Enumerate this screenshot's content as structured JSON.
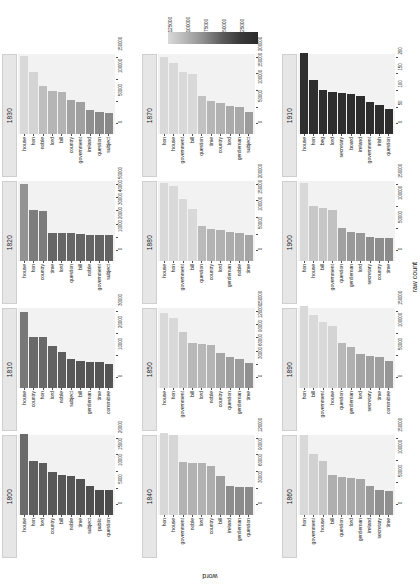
{
  "legend": {
    "title": "",
    "ticks": [
      "125000",
      "100000",
      "75000",
      "50000",
      "25000"
    ],
    "gradient_light": "#d9d9d9",
    "gradient_dark": "#2a2a2a"
  },
  "axes": {
    "y_title": "raw count",
    "x_title": "word"
  },
  "chart_data": {
    "type": "bar",
    "title": "",
    "xlabel": "word",
    "ylabel": "raw count",
    "grid": false,
    "legend_position": "top",
    "colorbar": {
      "ticks": [
        125000,
        100000,
        75000,
        50000,
        25000
      ],
      "maps_to": "raw count",
      "scale": "light = high count, dark = low count"
    },
    "facet_layout": {
      "rows": 4,
      "cols": 3,
      "facet_variable": "decade"
    },
    "facets": [
      {
        "decade": "1830",
        "ylim": [
          0,
          150000
        ],
        "yticks": [
          "0",
          "50000",
          "100000",
          "150000"
        ],
        "categories": [
          "house",
          "hon",
          "noble",
          "lord",
          "bill",
          "country",
          "government",
          "ireland",
          "question",
          "subject"
        ],
        "values": [
          148000,
          118000,
          92000,
          82000,
          80000,
          64000,
          61000,
          46000,
          41000,
          40000
        ]
      },
      {
        "decade": "1870",
        "ylim": [
          0,
          200000
        ],
        "yticks": [
          "0",
          "50000",
          "100000",
          "150000",
          "200000"
        ],
        "categories": [
          "hon",
          "house",
          "government",
          "bill",
          "question",
          "time",
          "country",
          "lord",
          "gentleman",
          "subject"
        ],
        "values": [
          196000,
          180000,
          158000,
          152000,
          97000,
          83000,
          79000,
          71000,
          69000,
          57000
        ]
      },
      {
        "decade": "1910",
        "ylim": [
          0,
          200
        ],
        "yticks": [
          "0",
          "50",
          "100",
          "150",
          "200"
        ],
        "categories": [
          "house",
          "hon",
          "beg",
          "lord",
          "secretary",
          "board",
          "ireland",
          "government",
          "irish",
          "question"
        ],
        "values": [
          205,
          138,
          112,
          107,
          103,
          102,
          97,
          82,
          74,
          63
        ]
      },
      {
        "decade": "1820",
        "ylim": [
          0,
          50000
        ],
        "yticks": [
          "0",
          "10000",
          "20000",
          "30000",
          "40000",
          "50000"
        ],
        "categories": [
          "house",
          "hon",
          "country",
          "time",
          "lord",
          "question",
          "bill",
          "noble",
          "government",
          "subject"
        ],
        "values": [
          49000,
          32000,
          31500,
          18000,
          17800,
          17600,
          17000,
          16700,
          16500,
          16300
        ]
      },
      {
        "decade": "1880",
        "ylim": [
          0,
          200000
        ],
        "yticks": [
          "0",
          "50000",
          "100000",
          "150000",
          "200000"
        ],
        "categories": [
          "house",
          "hon",
          "government",
          "bill",
          "question",
          "country",
          "lord",
          "gentleman",
          "noble",
          "time"
        ],
        "values": [
          198000,
          190000,
          158000,
          132000,
          88000,
          80000,
          78000,
          73000,
          71000,
          66000
        ]
      },
      {
        "decade": "1900",
        "ylim": [
          0,
          150000
        ],
        "yticks": [
          "0",
          "50000",
          "100000",
          "150000"
        ],
        "categories": [
          "hon",
          "house",
          "bill",
          "government",
          "question",
          "gentleman",
          "lord",
          "secretary",
          "country",
          "time"
        ],
        "values": [
          148000,
          104000,
          101000,
          96000,
          62000,
          55000,
          54000,
          45000,
          44000,
          43000
        ]
      },
      {
        "decade": "1810",
        "ylim": [
          0,
          30000
        ],
        "yticks": [
          "0",
          "10000",
          "20000",
          "30000"
        ],
        "categories": [
          "house",
          "country",
          "hon",
          "lord",
          "noble",
          "subject",
          "bill",
          "gentleman",
          "time",
          "committee"
        ],
        "values": [
          29000,
          19500,
          19400,
          16000,
          13500,
          11000,
          10200,
          9800,
          9700,
          9000
        ]
      },
      {
        "decade": "1850",
        "ylim": [
          0,
          150000
        ],
        "yticks": [
          "0",
          "30000",
          "60000",
          "90000",
          "120000",
          "150000"
        ],
        "categories": [
          "house",
          "hon",
          "government",
          "bill",
          "lord",
          "noble",
          "country",
          "question",
          "gentleman",
          "time"
        ],
        "values": [
          143000,
          132000,
          106000,
          85000,
          84000,
          81000,
          67000,
          59000,
          56000,
          47000
        ]
      },
      {
        "decade": "1890",
        "ylim": [
          0,
          150000
        ],
        "yticks": [
          "0",
          "50000",
          "100000",
          "150000"
        ],
        "categories": [
          "hon",
          "bill",
          "government",
          "house",
          "question",
          "gentleman",
          "lord",
          "secretary",
          "time",
          "committee"
        ],
        "values": [
          155000,
          138000,
          126000,
          118000,
          86000,
          77000,
          65000,
          61000,
          59000,
          52000
        ]
      },
      {
        "decade": "1800",
        "ylim": [
          0,
          20000
        ],
        "yticks": [
          "0",
          "5000",
          "10000",
          "15000",
          "20000"
        ],
        "categories": [
          "house",
          "hon",
          "lord",
          "country",
          "bill",
          "noble",
          "time",
          "subject",
          "public",
          "question"
        ],
        "values": [
          20500,
          13800,
          13200,
          10800,
          10100,
          9900,
          9000,
          7300,
          6400,
          6300
        ]
      },
      {
        "decade": "1840",
        "ylim": [
          0,
          120000
        ],
        "yticks": [
          "0",
          "30000",
          "60000",
          "90000",
          "120000"
        ],
        "categories": [
          "hon",
          "house",
          "government",
          "noble",
          "lord",
          "country",
          "bill",
          "ireland",
          "gentleman",
          "question"
        ],
        "values": [
          124000,
          121000,
          80000,
          79500,
          79000,
          74000,
          59000,
          44000,
          43000,
          42000
        ]
      },
      {
        "decade": "1860",
        "ylim": [
          0,
          150000
        ],
        "yticks": [
          "0",
          "50000",
          "100000",
          "150000"
        ],
        "categories": [
          "hon",
          "government",
          "house",
          "bill",
          "question",
          "lord",
          "gentleman",
          "ireland",
          "secretary",
          "time"
        ],
        "values": [
          152000,
          115000,
          103000,
          76000,
          72000,
          70000,
          68000,
          55000,
          47000,
          46000
        ]
      }
    ]
  }
}
